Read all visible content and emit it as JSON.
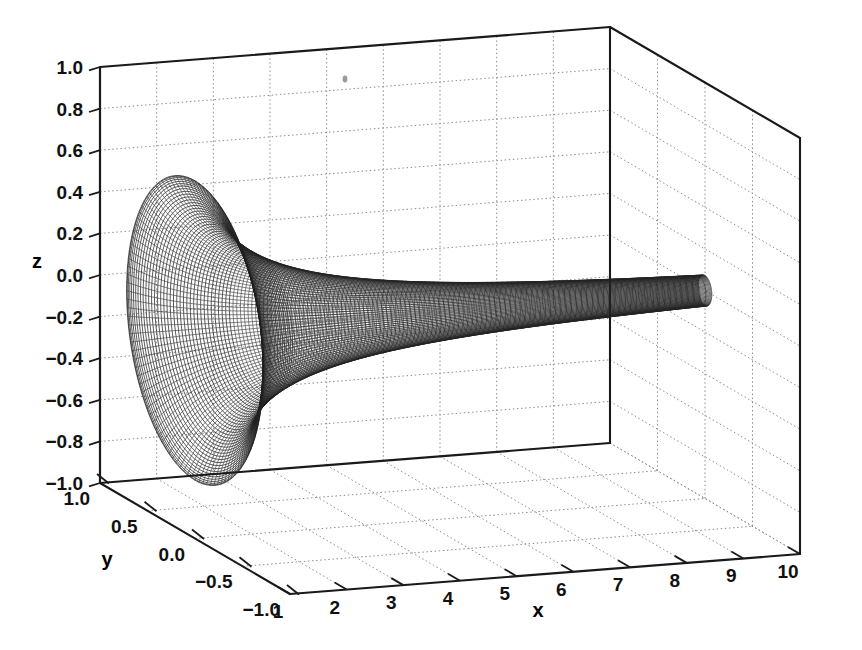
{
  "figure": {
    "kind": "3d-mesh-surface",
    "background_color": "#ffffff",
    "line_color": "#1c1c1c",
    "grid_color": "#8d8d8d",
    "axis_color": "#1a1a1a"
  },
  "chart_data": {
    "type": "line",
    "title": "",
    "subtitle": "",
    "xlabel": "x",
    "ylabel": "y",
    "zlabel": "z",
    "xlim": [
      1,
      10
    ],
    "ylim": [
      -1.0,
      1.0
    ],
    "zlim": [
      -1.0,
      1.0
    ],
    "grid": true,
    "legend": "none",
    "projection": "3d",
    "surface": {
      "name": "horn",
      "equation": "y = r(x)*cos(t), z = r(x)*sin(t)",
      "radius_profile": "r(x) = 0.72 / x",
      "u_param": "x from 1 to 10",
      "v_param": "t from 0 to 2*pi",
      "radius_at_x": [
        {
          "x": 1,
          "r": 0.72
        },
        {
          "x": 2,
          "r": 0.36
        },
        {
          "x": 3,
          "r": 0.24
        },
        {
          "x": 4,
          "r": 0.18
        },
        {
          "x": 5,
          "r": 0.144
        },
        {
          "x": 6,
          "r": 0.12
        },
        {
          "x": 7,
          "r": 0.103
        },
        {
          "x": 8,
          "r": 0.09
        },
        {
          "x": 9,
          "r": 0.08
        },
        {
          "x": 10,
          "r": 0.072
        }
      ],
      "n_rings": 60,
      "n_spokes": 96
    },
    "x_ticks": [
      {
        "value": 1,
        "label": "1"
      },
      {
        "value": 2,
        "label": "2"
      },
      {
        "value": 3,
        "label": "3"
      },
      {
        "value": 4,
        "label": "4"
      },
      {
        "value": 5,
        "label": "5"
      },
      {
        "value": 6,
        "label": "6"
      },
      {
        "value": 7,
        "label": "7"
      },
      {
        "value": 8,
        "label": "8"
      },
      {
        "value": 9,
        "label": "9"
      },
      {
        "value": 10,
        "label": "10"
      }
    ],
    "y_ticks": [
      {
        "value": 1.0,
        "label": "1.0"
      },
      {
        "value": 0.5,
        "label": "0.5"
      },
      {
        "value": 0.0,
        "label": "0.0"
      },
      {
        "value": -0.5,
        "label": "−0.5"
      },
      {
        "value": -1.0,
        "label": "−1.0"
      }
    ],
    "z_ticks": [
      {
        "value": 1.0,
        "label": "1.0"
      },
      {
        "value": 0.8,
        "label": "0.8"
      },
      {
        "value": 0.6,
        "label": "0.6"
      },
      {
        "value": 0.4,
        "label": "0.4"
      },
      {
        "value": 0.2,
        "label": "0.2"
      },
      {
        "value": 0.0,
        "label": "0.0"
      },
      {
        "value": -0.2,
        "label": "−0.2"
      },
      {
        "value": -0.4,
        "label": "−0.4"
      },
      {
        "value": -0.6,
        "label": "−0.6"
      },
      {
        "value": -0.8,
        "label": "−0.8"
      },
      {
        "value": -1.0,
        "label": "−1.0"
      }
    ]
  },
  "labels": {
    "x_axis_title": "x",
    "y_axis_title": "y",
    "z_axis_title": "z"
  }
}
